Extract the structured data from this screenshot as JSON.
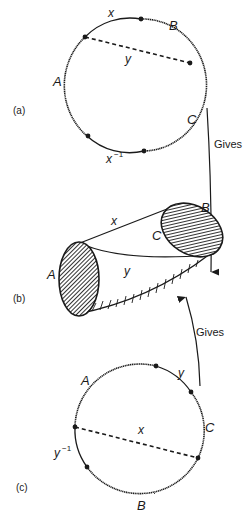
{
  "figure": {
    "panel_a": {
      "label": "(a)",
      "edge_labels": {
        "top": "x",
        "bottom": "x",
        "bottom_sup": "−1",
        "chord": "y"
      },
      "vertex_labels": {
        "A": "A",
        "B": "B",
        "C": "C"
      }
    },
    "arrow_a_to_b": {
      "label": "Gives"
    },
    "panel_b": {
      "label": "(b)",
      "edge_labels": {
        "x": "x",
        "y": "y"
      },
      "vertex_labels": {
        "A": "A",
        "B": "B",
        "C": "C"
      }
    },
    "arrow_c_to_b": {
      "label": "Gives"
    },
    "panel_c": {
      "label": "(c)",
      "edge_labels": {
        "top_right": "y",
        "left": "y",
        "left_sup": "−1",
        "chord": "x"
      },
      "vertex_labels": {
        "A": "A",
        "B": "B",
        "C": "C"
      }
    }
  },
  "colors": {
    "ink": "#1a1a1a",
    "background": "#ffffff"
  }
}
